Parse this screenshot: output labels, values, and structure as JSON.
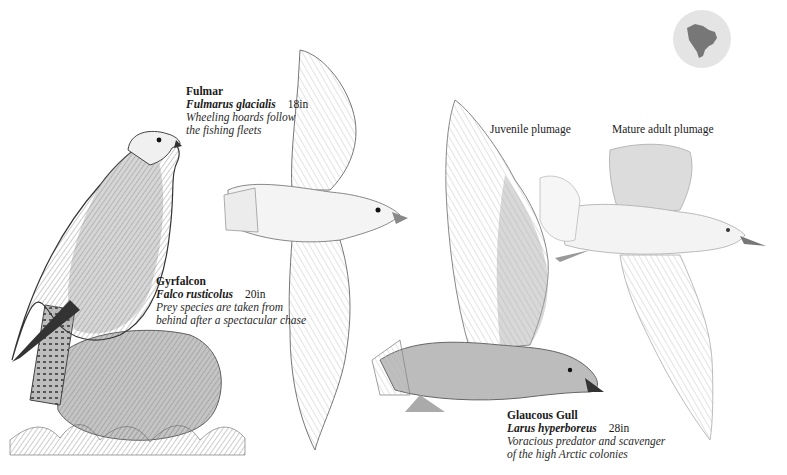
{
  "range_map": {
    "icon": "north-america-globe-icon",
    "fill": "#e4e4e4",
    "land": "#777777"
  },
  "species": [
    {
      "name": "Fulmar",
      "scientific": "Fulmarus glacialis",
      "size": "18in",
      "note_line1": "Wheeling hoards follow",
      "note_line2": "the fishing fleets"
    },
    {
      "name": "Gyrfalcon",
      "scientific": "Falco rusticolus",
      "size": "20in",
      "note_line1": "Prey species are taken from",
      "note_line2": "behind after a spectacular chase"
    },
    {
      "name": "Glaucous Gull",
      "scientific": "Larus hyperboreus",
      "size": "28in",
      "note_line1": "Voracious predator and scavenger",
      "note_line2": "of the high Arctic colonies"
    }
  ],
  "plumage_labels": {
    "juvenile": "Juvenile plumage",
    "adult": "Mature adult plumage"
  }
}
